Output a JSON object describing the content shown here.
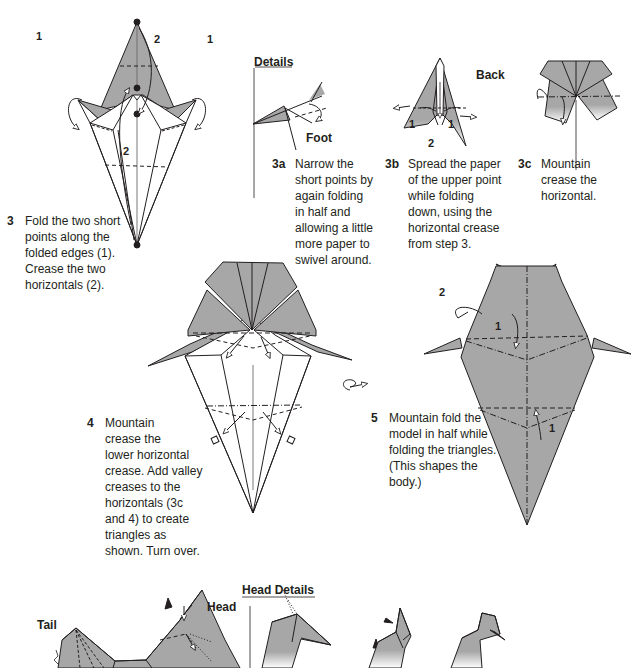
{
  "page": {
    "colors": {
      "paper_gray": "#a7a7a7",
      "ink": "#231f20",
      "background": "#ffffff"
    }
  },
  "steps": {
    "s3": {
      "number": "3",
      "lines": [
        "Fold the two short",
        "points along the",
        "folded edges (1).",
        "Crease the two",
        "horizontals (2)."
      ],
      "markers": {
        "left": "1",
        "right": "1",
        "upper": "2",
        "lower": "2"
      }
    },
    "s3a": {
      "number": "3a",
      "lines": [
        "Narrow the",
        "short points by",
        "again folding",
        "in half and",
        "allowing a little",
        "more paper to",
        "swivel around."
      ]
    },
    "s3b": {
      "number": "3b",
      "lines": [
        "Spread the paper",
        "of the upper point",
        "while folding",
        "down, using the",
        "horizontal crease",
        "from step 3."
      ],
      "markers": {
        "left": "1",
        "right": "1",
        "bottom": "2"
      }
    },
    "s3c": {
      "number": "3c",
      "lines": [
        "Mountain",
        "crease the",
        "horizontal."
      ]
    },
    "s4": {
      "number": "4",
      "lines": [
        "Mountain",
        "crease the",
        "lower horizontal",
        "crease. Add valley",
        "creases to the",
        "horizontals (3c",
        "and 4) to create",
        "triangles as",
        "shown. Turn over."
      ]
    },
    "s5": {
      "number": "5",
      "lines": [
        "Mountain fold the",
        "model in half while",
        "folding the triangles.",
        "(This shapes the",
        "body.)"
      ],
      "markers": {
        "top_1": "1",
        "top_2": "2",
        "bottom_1": "1"
      }
    }
  },
  "labels": {
    "details": "Details",
    "foot": "Foot",
    "back": "Back",
    "tail": "Tail",
    "head": "Head",
    "head_details": "Head Details"
  }
}
